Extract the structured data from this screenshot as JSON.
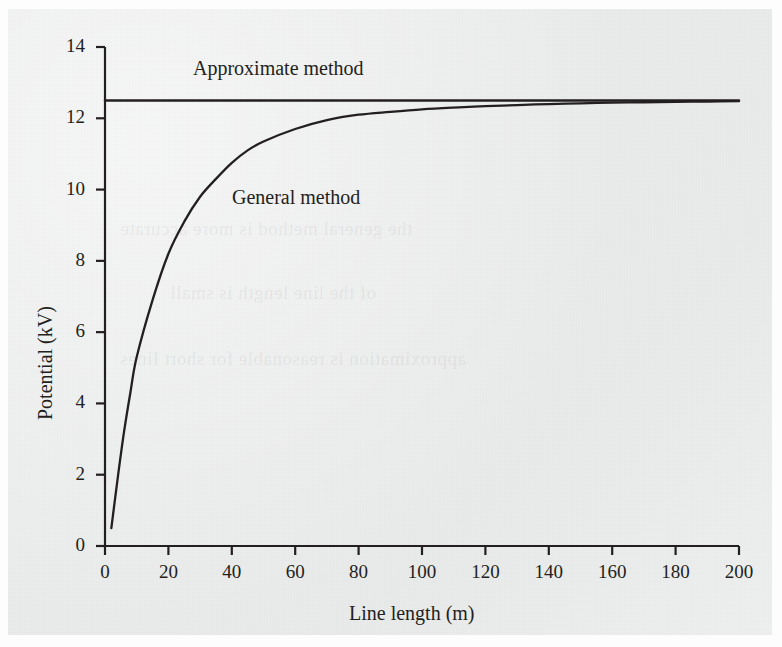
{
  "chart_data": {
    "type": "line",
    "title": "",
    "xlabel": "Line length (m)",
    "ylabel": "Potential (kV)",
    "xlim": [
      0,
      200
    ],
    "ylim": [
      0,
      14
    ],
    "xticks": [
      0,
      20,
      40,
      60,
      80,
      100,
      120,
      140,
      160,
      180,
      200
    ],
    "yticks": [
      0,
      2,
      4,
      6,
      8,
      10,
      12,
      14
    ],
    "grid": false,
    "legend_position": "inline-annotation",
    "line_color": "#231f20",
    "series": [
      {
        "name": "Approximate method",
        "annotation": "Approximate method",
        "annotation_x": 52,
        "annotation_y": 13.3,
        "x": [
          0,
          200
        ],
        "values": [
          12.5,
          12.5
        ]
      },
      {
        "name": "General method",
        "annotation": "General method",
        "annotation_x": 58,
        "annotation_y": 9.6,
        "x": [
          2,
          4,
          6,
          8,
          10,
          15,
          20,
          25,
          30,
          35,
          40,
          45,
          50,
          60,
          70,
          80,
          90,
          100,
          110,
          120,
          130,
          140,
          150,
          160,
          170,
          180,
          190,
          200
        ],
        "values": [
          0.5,
          1.9,
          3.2,
          4.3,
          5.3,
          6.9,
          8.2,
          9.1,
          9.8,
          10.3,
          10.75,
          11.1,
          11.35,
          11.7,
          11.95,
          12.1,
          12.18,
          12.25,
          12.3,
          12.34,
          12.37,
          12.4,
          12.42,
          12.44,
          12.45,
          12.46,
          12.47,
          12.48
        ]
      }
    ]
  },
  "axes": {
    "x_tick_labels": [
      "0",
      "20",
      "40",
      "60",
      "80",
      "100",
      "120",
      "140",
      "160",
      "180",
      "200"
    ],
    "y_tick_labels": [
      "0",
      "2",
      "4",
      "6",
      "8",
      "10",
      "12",
      "14"
    ],
    "x_axis_title": "Line length (m)",
    "y_axis_title": "Potential (kV)"
  },
  "annotations": {
    "approximate": "Approximate method",
    "general": "General method"
  },
  "ghost_text": {
    "lines": [
      "the general method is more accurate",
      "of the line length is small",
      "approximation is reasonable for short lines"
    ]
  }
}
